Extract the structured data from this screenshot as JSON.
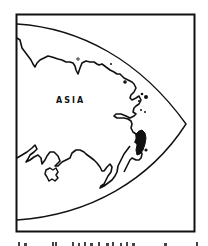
{
  "map": {
    "label": "ASIA",
    "colors": {
      "ink": "#111111",
      "background": "#ffffff"
    },
    "elements": [
      "frame",
      "curved-boundary",
      "coastline",
      "islands"
    ]
  },
  "caption": {
    "text": "",
    "truncated": true
  }
}
